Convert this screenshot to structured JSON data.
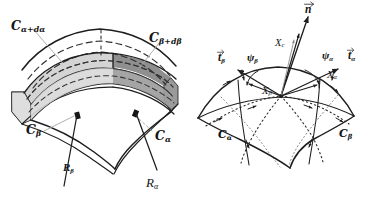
{
  "figure": {
    "panels": [
      {
        "id": "left",
        "caption": "Curved shell element bounded by coordinate lines"
      },
      {
        "id": "right",
        "caption": "Surface patch with tangent vectors and unit normal"
      }
    ],
    "colors": {
      "ink": "#141414",
      "stroke": "#2b2b2b",
      "band_light": "#d2d2d2",
      "band_dark": "#8d8d8d",
      "band_mid": "#b8b8b8",
      "leader": "#9a9a9a",
      "background": "#ffffff"
    }
  },
  "left_panel": {
    "labels": {
      "c_alpha_plus_dalpha": {
        "base": "C",
        "sub": "α+dα"
      },
      "c_beta_plus_dbeta": {
        "base": "C",
        "sub": "β+dβ"
      },
      "c_beta": {
        "base": "C",
        "sub": "β"
      },
      "c_alpha": {
        "base": "C",
        "sub": "α"
      },
      "r_beta": {
        "base": "R",
        "sub": "β"
      },
      "r_alpha": {
        "base": "R",
        "sub": "α"
      }
    }
  },
  "right_panel": {
    "labels": {
      "n_vector": {
        "base": "n",
        "sub": ""
      },
      "t_beta": {
        "base": "t",
        "sub": "β"
      },
      "t_alpha": {
        "base": "t",
        "sub": "α"
      },
      "psi_beta": {
        "base": "ψ",
        "sub": "β"
      },
      "psi_alpha": {
        "base": "ψ",
        "sub": "α"
      },
      "x_c": {
        "base": "X",
        "sub": "c"
      },
      "x_beta": {
        "base": "X",
        "sub": "β"
      },
      "x_alpha": {
        "base": "X",
        "sub": "α"
      },
      "c_alpha": {
        "base": "C",
        "sub": "α"
      },
      "c_beta": {
        "base": "C",
        "sub": "β"
      }
    }
  }
}
